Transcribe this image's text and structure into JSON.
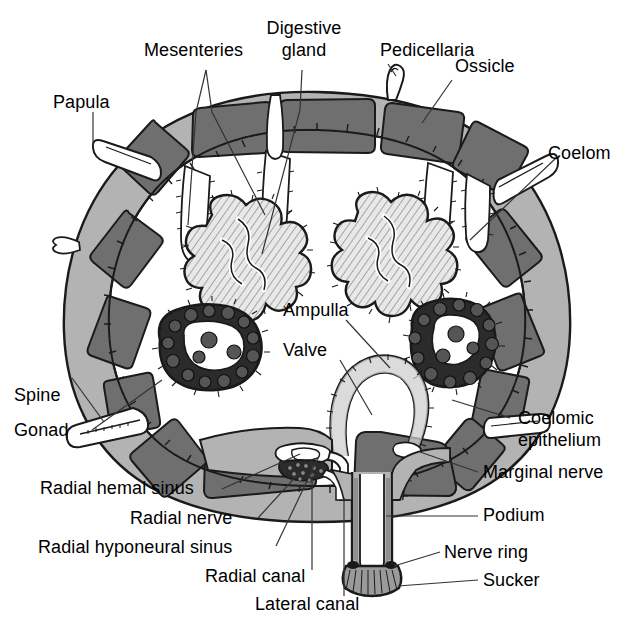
{
  "figure": {
    "colors": {
      "ossicle_fill": "#6f6f6f",
      "body_wall_fill": "#b3b3b3",
      "coelom_fill": "#ffffff",
      "gonad_fill": "#2b2b2b",
      "outline": "#1a1a1a",
      "background": "#ffffff",
      "leader_line": "#333333",
      "digestive_gland_fill": "#d9d9d9"
    }
  },
  "labels": {
    "mesenteries": "Mesenteries",
    "digestive_gland_line1": "Digestive",
    "digestive_gland_line2": "gland",
    "pedicellaria": "Pedicellaria",
    "ossicle": "Ossicle",
    "papula": "Papula",
    "coelom": "Coelom",
    "ampulla": "Ampulla",
    "valve": "Valve",
    "spine": "Spine",
    "gonad": "Gonad",
    "coelomic_epithelium_line1": "Coelomic",
    "coelomic_epithelium_line2": "epithelium",
    "marginal_nerve": "Marginal nerve",
    "podium": "Podium",
    "nerve_ring": "Nerve ring",
    "sucker": "Sucker",
    "radial_hemal_sinus": "Radial hemal sinus",
    "radial_nerve": "Radial nerve",
    "radial_hyponeural_sinus": "Radial hyponeural sinus",
    "radial_canal": "Radial canal",
    "lateral_canal": "Lateral canal"
  },
  "structures": [
    {
      "name": "ossicle",
      "count": 14,
      "description": "dark gray skeletal plates embedded in body wall"
    },
    {
      "name": "papula",
      "count": 2,
      "description": "thin-walled outpocketing of body wall"
    },
    {
      "name": "spine",
      "count": 1,
      "description": "elongate pointed projection on lower left"
    },
    {
      "name": "pedicellaria",
      "count": 1,
      "description": "small pincer-like projection at top"
    },
    {
      "name": "digestive-gland",
      "count": 2,
      "description": "lobed pyloric caeca with radial ciliated hatching"
    },
    {
      "name": "gonad",
      "count": 2,
      "description": "dark mass of oocytes"
    },
    {
      "name": "ampulla",
      "count": 1,
      "description": "bulbous muscular sac above podium"
    },
    {
      "name": "podium",
      "count": 1,
      "description": "tube foot extending ventrally"
    },
    {
      "name": "sucker",
      "count": 1,
      "description": "flared disc at tip of podium"
    },
    {
      "name": "mesentery",
      "count": 2,
      "description": "suspensory membranes from aboral wall"
    }
  ]
}
